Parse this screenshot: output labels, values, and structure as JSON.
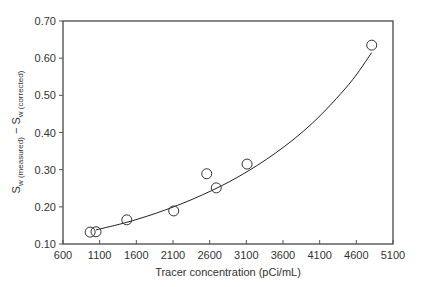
{
  "chart_data": {
    "type": "scatter",
    "title": "",
    "xlabel": "Tracer concentration (pCi/mL)",
    "ylabel": {
      "main": "S",
      "sub1": "w (measured)",
      "mid": " − S",
      "sub2": "w (corrected)"
    },
    "xlim": [
      600,
      5100
    ],
    "ylim": [
      0.1,
      0.7
    ],
    "x_ticks": [
      600,
      1100,
      1600,
      2100,
      2600,
      3100,
      3600,
      4100,
      4600,
      5100
    ],
    "x_tick_labels": [
      "600",
      "1100",
      "1600",
      "2100",
      "2600",
      "3100",
      "3600",
      "4100",
      "4600",
      "5100"
    ],
    "y_ticks": [
      0.1,
      0.2,
      0.3,
      0.4,
      0.5,
      0.6,
      0.7
    ],
    "y_tick_labels": [
      "0.10",
      "0.20",
      "0.30",
      "0.40",
      "0.50",
      "0.60",
      "0.70"
    ],
    "grid": false,
    "legend": null,
    "series": [
      {
        "name": "measured",
        "marker": "open-circle",
        "x": [
          970,
          1050,
          1470,
          2110,
          2560,
          2690,
          3110,
          4810
        ],
        "y": [
          0.132,
          0.133,
          0.165,
          0.189,
          0.289,
          0.251,
          0.315,
          0.635
        ]
      },
      {
        "name": "fit",
        "style": "line",
        "x": [
          1050,
          1500,
          2000,
          2500,
          3000,
          3500,
          4000,
          4500,
          4810
        ],
        "y": [
          0.138,
          0.16,
          0.192,
          0.232,
          0.282,
          0.345,
          0.425,
          0.53,
          0.615
        ]
      }
    ],
    "colors": {
      "axis": "#555555",
      "marker": "#333333",
      "line": "#222222",
      "text": "#333333"
    }
  }
}
